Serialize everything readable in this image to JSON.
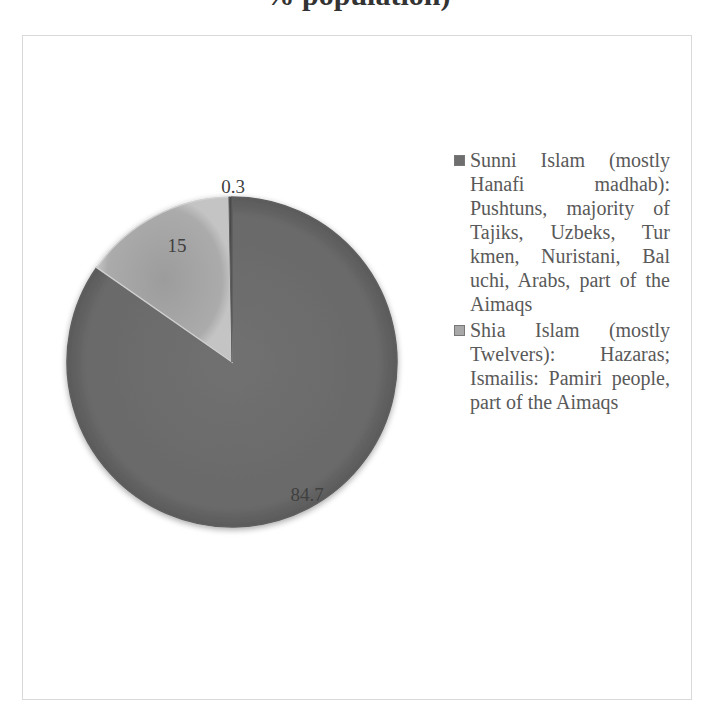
{
  "title": "% population)",
  "chart_data": {
    "type": "pie",
    "title": "% population)",
    "categories": [
      "Sunni Islam (mostly Hanafi madhab): Pushtuns, majority of Tajiks, Uzbeks, Turkmen, Nuristani, Baluchi, Arabs, part of the Aimaqs",
      "Shia Islam (mostly Twelvers): Hazaras; Ismailis: Pamiri people, part of the Aimaqs",
      "Other"
    ],
    "values": [
      84.7,
      15,
      0.3
    ],
    "data_labels": [
      "84.7",
      "15",
      "0.3"
    ],
    "colors": [
      "#6e6e6e",
      "#b0b0b0",
      "#4a4a4a"
    ],
    "legend_position": "right",
    "start_angle_deg": 0,
    "direction": "clockwise"
  },
  "legend": {
    "items": [
      {
        "label": "Sunni Islam (mostly Hanafi madhab): Pushtuns, majority of Tajiks, Uzbeks, Tur kmen, Nuristani, Bal uchi, Arabs, part of the Aimaqs",
        "color": "#6e6e6e"
      },
      {
        "label": "Shia Islam (mostly Twelvers): Hazaras; Ismailis: Pamiri people, part of the Aimaqs",
        "color": "#a8a8a8"
      }
    ]
  },
  "labels": {
    "sunni": "84.7",
    "shia": "15",
    "other": "0.3"
  }
}
